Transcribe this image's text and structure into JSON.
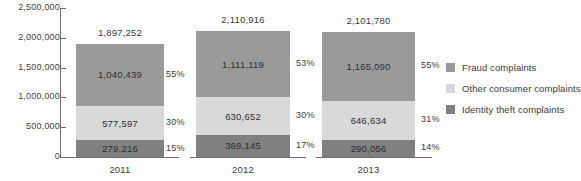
{
  "chart_data": {
    "type": "bar",
    "subtype": "stacked-vertical",
    "title": "",
    "xlabel": "",
    "ylabel": "",
    "categories": [
      "2011",
      "2012",
      "2013"
    ],
    "ylim": [
      0,
      2500000
    ],
    "ytick_labels": [
      "2,500,000",
      "2,000,000",
      "1,500,000",
      "1,000,000",
      "500,000",
      "0"
    ],
    "ytick_values": [
      2500000,
      2000000,
      1500000,
      1000000,
      500000,
      0
    ],
    "grid": false,
    "legend_position": "right",
    "stack_order_bottom_to_top": [
      "Identity theft complaints",
      "Other consumer complaints",
      "Fraud complaints"
    ],
    "series": [
      {
        "name": "Fraud complaints",
        "color": "#9a9a9a",
        "values": [
          1040439,
          1111119,
          1165090
        ],
        "value_labels": [
          "1,040,439",
          "1,111,119",
          "1,165,090"
        ],
        "percent_labels": [
          "55%",
          "53%",
          "55%"
        ]
      },
      {
        "name": "Other consumer complaints",
        "color": "#d9d9d9",
        "values": [
          577597,
          630652,
          646634
        ],
        "value_labels": [
          "577,597",
          "630,652",
          "646,634"
        ],
        "percent_labels": [
          "30%",
          "30%",
          "31%"
        ]
      },
      {
        "name": "Identity theft complaints",
        "color": "#808080",
        "values": [
          279216,
          369145,
          290056
        ],
        "value_labels": [
          "279,216",
          "369,145",
          "290,056"
        ],
        "percent_labels": [
          "15%",
          "17%",
          "14%"
        ]
      }
    ],
    "totals": [
      1897252,
      2110916,
      2101780
    ],
    "total_labels": [
      "1,897,252",
      "2,110,916",
      "2,101,780"
    ]
  },
  "legend": {
    "items": [
      {
        "label": "Fraud complaints",
        "color": "#9a9a9a"
      },
      {
        "label": "Other consumer complaints",
        "color": "#d9d9d9"
      },
      {
        "label": "Identity theft complaints",
        "color": "#808080"
      }
    ]
  },
  "axis": {
    "line_color": "#6e6e6e"
  }
}
